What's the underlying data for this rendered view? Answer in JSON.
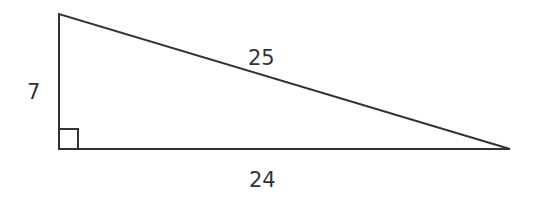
{
  "diagram": {
    "type": "right-triangle",
    "stroke_color": "#333333",
    "vertices": {
      "top": [
        59,
        14
      ],
      "right_angle": [
        59,
        149
      ],
      "far": [
        510,
        149
      ]
    },
    "labels": {
      "vertical_leg": "7",
      "horizontal_leg": "24",
      "hypotenuse": "25"
    },
    "right_angle_marker": true
  }
}
